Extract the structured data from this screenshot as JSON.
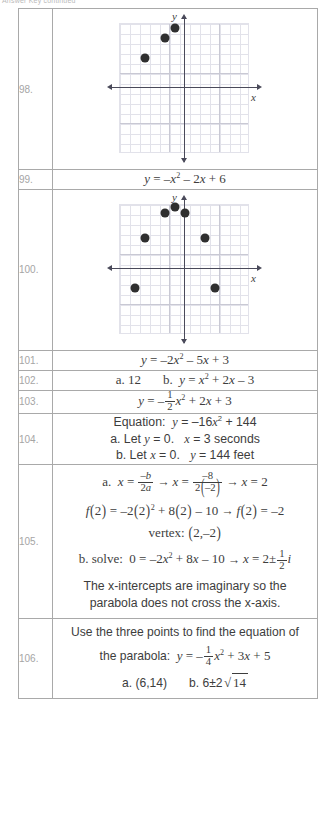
{
  "header": {
    "text": "Answer Key continued"
  },
  "icons": {
    "point": "data-point-icon",
    "axis_arrow": "axis-arrow-icon"
  },
  "table": {
    "rows": [
      {
        "number": "98.",
        "type": "graph",
        "graph": {
          "x_label": "x",
          "y_label": "y",
          "grid_spacing": 1,
          "points": [
            [
              -4,
              3
            ],
            [
              -2,
              5
            ],
            [
              -1,
              6
            ]
          ]
        }
      },
      {
        "number": "99.",
        "type": "equation",
        "lines": [
          "y = –x² – 2x + 6"
        ]
      },
      {
        "number": "100.",
        "type": "graph",
        "graph": {
          "x_label": "x",
          "y_label": "y",
          "grid_spacing": 1,
          "points": [
            [
              -4,
              1
            ],
            [
              -2,
              4
            ],
            [
              -1,
              5
            ],
            [
              0,
              4
            ],
            [
              2,
              4
            ],
            [
              -3,
              1
            ],
            [
              1,
              1
            ]
          ]
        }
      },
      {
        "number": "101.",
        "type": "equation",
        "lines": [
          "y = –2x² – 5x + 3"
        ]
      },
      {
        "number": "102.",
        "type": "equation",
        "lines": [
          "a.  12        b.  y = x² + 2x – 3"
        ]
      },
      {
        "number": "103.",
        "type": "equation",
        "lines": [
          "y = –(1/2)x² + 2x + 3"
        ]
      },
      {
        "number": "104.",
        "type": "text",
        "lines": [
          "Equation:  y = –16x² + 144",
          "a.  Let y = 0.   x = 3 seconds",
          "b.  Let x = 0.   y = 144 feet"
        ]
      },
      {
        "number": "105.",
        "type": "work",
        "lines": [
          "a.  x = –b/2a → x = –8/2(–2) → x = 2",
          "f(2) = –2(2)² + 8(2) – 10 → f(2) = –2",
          "vertex: (2,–2)",
          "b.  solve: 0 = –2x² + 8x – 10 → x = 2 ± (1/2)i",
          "The x-intercepts are imaginary so the",
          "parabola does not cross the x-axis."
        ]
      },
      {
        "number": "106.",
        "type": "work",
        "lines": [
          "Use the three points to find the equation of",
          "the parabola:  y = –(1/4)x² + 3x + 5",
          "a.  (6,14)        b.  6 ± 2√14"
        ]
      }
    ],
    "row_104": {
      "label_equation": "Equation:",
      "part_a_prefix": "a.  Let",
      "part_a_cond": "= 0.",
      "part_a_result": "= 3 seconds",
      "part_b_prefix": "b.  Let",
      "part_b_cond": "= 0.",
      "part_b_result": "= 144 feet"
    },
    "row_105": {
      "part_a": "a.",
      "vertex_label": "vertex:",
      "part_b": "b.  solve:",
      "note_line1": "The x-intercepts are imaginary so the",
      "note_line2": "parabola does not cross the x-axis."
    },
    "row_106": {
      "line1": "Use the three points to find the equation of",
      "line2_prefix": "the parabola:",
      "part_a": "a.  (6,14)",
      "part_b_prefix": "b.  6±2"
    },
    "row_102": {
      "part_a": "a.  12",
      "part_b_prefix": "b."
    }
  },
  "colors": {
    "border": "#a9a9a9",
    "number_text": "#a5a5a5",
    "body_text": "#3d3d3d",
    "grid_minor": "#e2e2ea",
    "grid_major": "#c9c9d4",
    "axis": "#4a4a5a",
    "point": "#2f2f2f"
  }
}
